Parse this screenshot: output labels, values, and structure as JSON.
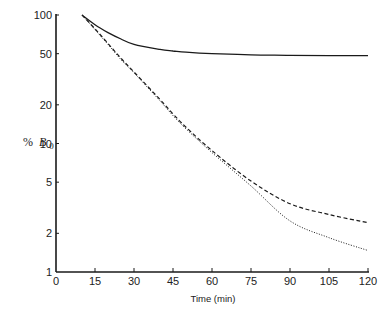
{
  "chart_data": {
    "type": "line",
    "title": "",
    "xlabel": "Time (min)",
    "ylabel": "% B0",
    "ylabel_parts": {
      "prefix": "%",
      "var": "B",
      "sub": "0"
    },
    "xlim": [
      0,
      120
    ],
    "ylim": [
      1,
      100
    ],
    "yscale": "log",
    "grid": false,
    "legend": null,
    "x_ticks": [
      0,
      15,
      30,
      45,
      60,
      75,
      90,
      105,
      120
    ],
    "y_ticks": [
      1,
      2,
      5,
      10,
      20,
      50,
      100
    ],
    "x": [
      10,
      15,
      20,
      25,
      30,
      40,
      45,
      50,
      60,
      75,
      90,
      105,
      120
    ],
    "series": [
      {
        "name": "solid",
        "style": "solid",
        "values": [
          100,
          84,
          73,
          65,
          59,
          54,
          52.5,
          51.3,
          50,
          49,
          48.6,
          48.3,
          48.2
        ]
      },
      {
        "name": "dashed",
        "style": "dashed",
        "values": [
          100,
          78,
          60,
          46,
          36,
          22,
          17,
          13.4,
          8.8,
          5.1,
          3.4,
          2.8,
          2.42
        ]
      },
      {
        "name": "dotted",
        "style": "dotted",
        "values": [
          100,
          77,
          59,
          45,
          35.5,
          21.5,
          16.5,
          13,
          8.5,
          4.67,
          2.5,
          1.85,
          1.47
        ]
      }
    ]
  },
  "colors": {
    "axis": "#1a1a1a",
    "line": "#1a1a1a",
    "background": "#ffffff"
  }
}
